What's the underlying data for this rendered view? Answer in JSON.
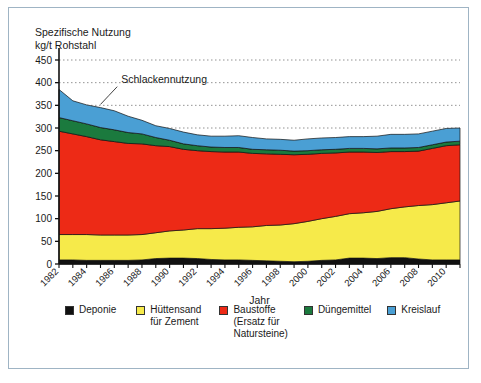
{
  "axis_title": "Spezifische Nutzung\nkg/t Rohstahl",
  "annotation": "Schlackennutzung",
  "xlabel": "Jahr",
  "colors": {
    "deponie": "#111111",
    "huettensand": "#f6ea4a",
    "baustoffe": "#ed2a16",
    "duengemittel": "#1b7a3e",
    "kreislauf": "#4a9fd4",
    "border": "#9fb4c4",
    "grid": "#777777",
    "axis": "#111111"
  },
  "legend": [
    {
      "label": "Deponie",
      "color": "#111111"
    },
    {
      "label": "Hüttensand\nfür Zement",
      "color": "#f6ea4a"
    },
    {
      "label": "Baustoffe\n(Ersatz für\nNatursteine)",
      "color": "#ed2a16"
    },
    {
      "label": "Düngemittel",
      "color": "#1b7a3e"
    },
    {
      "label": "Kreislauf",
      "color": "#4a9fd4"
    }
  ],
  "chart_data": {
    "type": "area",
    "title": "",
    "xlabel": "Jahr",
    "ylabel": "Spezifische Nutzung kg/t Rohstahl",
    "ylim": [
      0,
      450
    ],
    "ytick_step": 50,
    "yticks": [
      0,
      50,
      100,
      150,
      200,
      250,
      300,
      350,
      400,
      450
    ],
    "xlim": [
      1982,
      2011
    ],
    "xticks": [
      1982,
      1984,
      1986,
      1988,
      1990,
      1992,
      1994,
      1996,
      1998,
      2000,
      2002,
      2004,
      2006,
      2008,
      2010
    ],
    "grid": "horizontal-dotted",
    "legend_position": "below",
    "stacked": true,
    "annotations": [
      {
        "text": "Schlackennutzung",
        "x": 1986.5,
        "y": 400,
        "points_to": {
          "x": 1985.0,
          "y": 352
        }
      }
    ],
    "x": [
      1982,
      1983,
      1984,
      1985,
      1986,
      1987,
      1988,
      1989,
      1990,
      1991,
      1992,
      1993,
      1994,
      1995,
      1996,
      1997,
      1998,
      1999,
      2000,
      2001,
      2002,
      2003,
      2004,
      2005,
      2006,
      2007,
      2008,
      2009,
      2010,
      2011
    ],
    "series": [
      {
        "name": "Deponie",
        "color": "#111111",
        "values": [
          9,
          9,
          8,
          8,
          8,
          8,
          9,
          12,
          13,
          13,
          12,
          10,
          9,
          9,
          8,
          7,
          6,
          5,
          6,
          8,
          9,
          13,
          13,
          12,
          14,
          14,
          11,
          9,
          9,
          9
        ]
      },
      {
        "name": "Hüttensand für Zement",
        "color": "#f6ea4a",
        "values": [
          56,
          56,
          57,
          56,
          56,
          56,
          56,
          57,
          60,
          62,
          66,
          68,
          70,
          72,
          74,
          78,
          80,
          84,
          88,
          92,
          96,
          98,
          100,
          104,
          108,
          112,
          118,
          122,
          126,
          130
        ]
      },
      {
        "name": "Baustoffe (Ersatz für Natursteine)",
        "color": "#ed2a16",
        "values": [
          228,
          222,
          216,
          210,
          206,
          202,
          200,
          192,
          186,
          178,
          172,
          170,
          168,
          166,
          162,
          158,
          156,
          152,
          148,
          144,
          140,
          136,
          134,
          130,
          126,
          122,
          120,
          124,
          126,
          124
        ]
      },
      {
        "name": "Düngemittel",
        "color": "#1b7a3e",
        "values": [
          30,
          29,
          28,
          27,
          26,
          24,
          22,
          18,
          14,
          12,
          11,
          10,
          10,
          10,
          9,
          9,
          9,
          8,
          8,
          8,
          8,
          8,
          8,
          8,
          8,
          8,
          8,
          8,
          8,
          8
        ]
      },
      {
        "name": "Kreislauf",
        "color": "#4a9fd4",
        "values": [
          62,
          44,
          42,
          44,
          42,
          36,
          30,
          26,
          26,
          26,
          24,
          24,
          25,
          26,
          26,
          24,
          24,
          24,
          26,
          26,
          26,
          26,
          26,
          28,
          30,
          30,
          30,
          30,
          30,
          29
        ]
      }
    ]
  }
}
